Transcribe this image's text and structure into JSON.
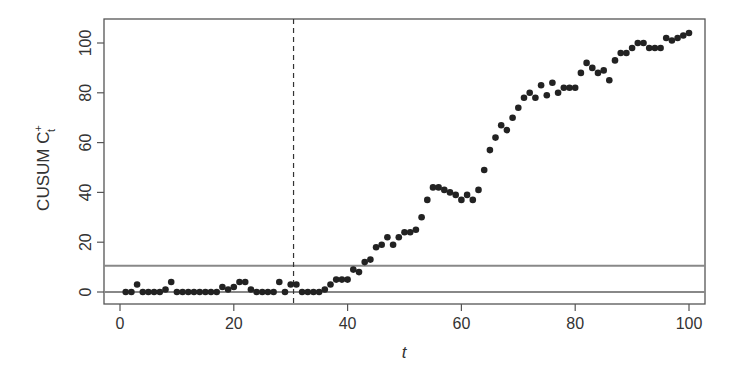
{
  "chart_data": {
    "type": "scatter",
    "title": "",
    "xlabel": "t",
    "ylabel": "CUSUM C_t^+",
    "ylabel_main": "CUSUM C",
    "ylabel_sup": "+",
    "ylabel_sub": "t",
    "xlim": [
      -3,
      103
    ],
    "ylim": [
      -4,
      109
    ],
    "x_ticks": [
      0,
      20,
      40,
      60,
      80,
      100
    ],
    "y_ticks": [
      0,
      20,
      40,
      60,
      80,
      100
    ],
    "grid": false,
    "legend": null,
    "reference_lines": {
      "horizontal": [
        {
          "y": 0,
          "style": "solid",
          "color": "#888888"
        },
        {
          "y": 10.5,
          "style": "solid",
          "color": "#888888"
        }
      ],
      "vertical": [
        {
          "x": 30.5,
          "style": "dashed",
          "color": "#333333"
        }
      ]
    },
    "marker_color": "#222222",
    "series": [
      {
        "name": "CUSUM C+",
        "x": [
          1,
          2,
          3,
          4,
          5,
          6,
          7,
          8,
          9,
          10,
          11,
          12,
          13,
          14,
          15,
          16,
          17,
          18,
          19,
          20,
          21,
          22,
          23,
          24,
          25,
          26,
          27,
          28,
          29,
          30,
          31,
          32,
          33,
          34,
          35,
          36,
          37,
          38,
          39,
          40,
          41,
          42,
          43,
          44,
          45,
          46,
          47,
          48,
          49,
          50,
          51,
          52,
          53,
          54,
          55,
          56,
          57,
          58,
          59,
          60,
          61,
          62,
          63,
          64,
          65,
          66,
          67,
          68,
          69,
          70,
          71,
          72,
          73,
          74,
          75,
          76,
          77,
          78,
          79,
          80,
          81,
          82,
          83,
          84,
          85,
          86,
          87,
          88,
          89,
          90,
          91,
          92,
          93,
          94,
          95,
          96,
          97,
          98,
          99,
          100
        ],
        "values": [
          0,
          0,
          3,
          0,
          0,
          0,
          0,
          1,
          4,
          0,
          0,
          0,
          0,
          0,
          0,
          0,
          0,
          2,
          1,
          2,
          4,
          4,
          1,
          0,
          0,
          0,
          0,
          4,
          0,
          3,
          3,
          0,
          0,
          0,
          0,
          1,
          3,
          5,
          5,
          5,
          9,
          8,
          12,
          13,
          18,
          19,
          22,
          19,
          22,
          24,
          24,
          25,
          30,
          37,
          42,
          42,
          41,
          40,
          39,
          37,
          39,
          37,
          41,
          49,
          57,
          62,
          67,
          65,
          70,
          74,
          78,
          80,
          78,
          83,
          79,
          84,
          80,
          82,
          82,
          82,
          88,
          92,
          90,
          88,
          89,
          85,
          93,
          96,
          96,
          98,
          100,
          100,
          98,
          98,
          98,
          102,
          101,
          102,
          103,
          104
        ]
      }
    ]
  }
}
